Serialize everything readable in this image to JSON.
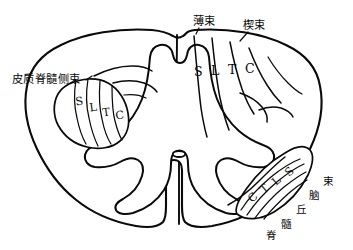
{
  "figure": {
    "ink_color": "#0a0a0a",
    "background_color": "#ffffff"
  },
  "labels": {
    "posterior_gracile": "薄束",
    "posterior_cuneate": "楔束",
    "lateral_corticospinal": "皮质脊髓侧束",
    "spinothalamic_chars": [
      "脊",
      "髓",
      "丘",
      "脑",
      "束"
    ]
  },
  "tracts": {
    "posterior_column": {
      "name": "posterior-column",
      "segments": [
        "S",
        "L",
        "T",
        "C"
      ]
    },
    "lateral_corticospinal": {
      "name": "lateral-corticospinal-tract",
      "segments": [
        "S",
        "L",
        "T",
        "C"
      ]
    },
    "spinothalamic": {
      "name": "spinothalamic-tract",
      "segments": [
        "C",
        "T",
        "L",
        "S"
      ]
    }
  },
  "structures": {
    "central_canal": "central-canal",
    "anterior_median_fissure": "anterior-median-fissure",
    "posterior_median_septum": "posterior-median-septum",
    "gray_matter": "gray-matter-butterfly"
  }
}
